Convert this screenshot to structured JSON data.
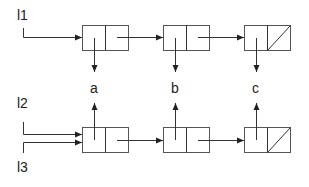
{
  "diagram": {
    "type": "linked-list-sharing",
    "variables": [
      {
        "name": "l1",
        "label": "l1",
        "points_to": "top-cell-1"
      },
      {
        "name": "l2",
        "label": "l2",
        "points_to": "bottom-cell-1"
      },
      {
        "name": "l3",
        "label": "l3",
        "points_to": "bottom-cell-1"
      }
    ],
    "values": [
      {
        "id": "a",
        "label": "a"
      },
      {
        "id": "b",
        "label": "b"
      },
      {
        "id": "c",
        "label": "c"
      }
    ],
    "top_list": {
      "cells": [
        {
          "id": "top-cell-1",
          "car": "a",
          "cdr": "top-cell-2"
        },
        {
          "id": "top-cell-2",
          "car": "b",
          "cdr": "top-cell-3"
        },
        {
          "id": "top-cell-3",
          "car": "c",
          "cdr": "nil"
        }
      ]
    },
    "bottom_list": {
      "cells": [
        {
          "id": "bottom-cell-1",
          "car": "a",
          "cdr": "bottom-cell-2"
        },
        {
          "id": "bottom-cell-2",
          "car": "b",
          "cdr": "bottom-cell-3"
        },
        {
          "id": "bottom-cell-3",
          "car": "c",
          "cdr": "nil"
        }
      ]
    },
    "colors": {
      "line": "#333333",
      "box": "#555555",
      "text": "#222222",
      "background": "#ffffff"
    }
  }
}
